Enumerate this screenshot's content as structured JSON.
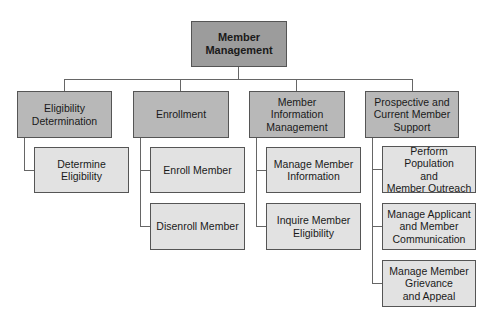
{
  "diagram": {
    "type": "org-chart",
    "root": {
      "label": "Member\nManagement"
    },
    "branches": [
      {
        "label": "Eligibility\nDetermination",
        "children": [
          {
            "label": "Determine Eligibility"
          }
        ]
      },
      {
        "label": "Enrollment",
        "children": [
          {
            "label": "Enroll Member"
          },
          {
            "label": "Disenroll Member"
          }
        ]
      },
      {
        "label": "Member Information\nManagement",
        "children": [
          {
            "label": "Manage Member\nInformation"
          },
          {
            "label": "Inquire Member\nEligibility"
          }
        ]
      },
      {
        "label": "Prospective and\nCurrent Member\nSupport",
        "children": [
          {
            "label": "Perform Population\nand\nMember Outreach"
          },
          {
            "label": "Manage Applicant\nand Member\nCommunication"
          },
          {
            "label": "Manage Member\nGrievance\nand Appeal"
          }
        ]
      }
    ],
    "colors": {
      "root": "#9c9c9c",
      "level2": "#b8b8b8",
      "level3": "#e2e2e2",
      "border": "#555555"
    }
  }
}
